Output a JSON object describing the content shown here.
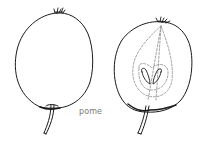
{
  "figure": {
    "label": "pome",
    "colors": {
      "line": "#1a1a1a",
      "dashed": "#8a8a8a",
      "label": "#7a7a7a",
      "background": "#ffffff"
    },
    "panels": [
      {
        "name": "whole-fruit",
        "view": "external"
      },
      {
        "name": "cut-fruit",
        "view": "longitudinal section",
        "features": [
          "calyx",
          "core outline",
          "seed chambers",
          "stalk"
        ]
      }
    ]
  }
}
